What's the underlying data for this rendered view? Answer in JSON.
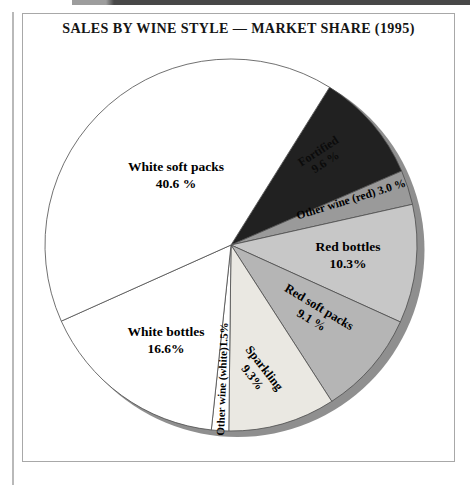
{
  "page": {
    "title": "SALES BY WINE STYLE — MARKET SHARE (1995)"
  },
  "chart_data": {
    "type": "pie",
    "title": "SALES BY WINE STYLE — MARKET SHARE (1995)",
    "year": "1995",
    "direction": "clockwise",
    "start_angle_deg": 32,
    "shadow_color": "#8f8f8f",
    "outline_color": "#4d4d4d",
    "slices": [
      {
        "label": "Fortified",
        "value": 9.6,
        "pct_label": "9.6 %",
        "color": "#212121"
      },
      {
        "label": "Other wine (red)",
        "value": 3.0,
        "pct_label": "3.0 %",
        "single_label": "Other wine (red) 3.0 %",
        "color": "#9a9a9a"
      },
      {
        "label": "Red bottles",
        "value": 10.3,
        "pct_label": "10.3%",
        "color": "#c7c7c7"
      },
      {
        "label": "Red soft packs",
        "value": 9.1,
        "pct_label": "9.1 %",
        "color": "#b5b5b5"
      },
      {
        "label": "Sparkling",
        "value": 9.3,
        "pct_label": "9.3%",
        "color": "#eae8e2"
      },
      {
        "label": "Other wine (white)",
        "value": 1.5,
        "pct_label": "1.5%",
        "single_label": "Other wine (white)1.5%",
        "color": "#ffffff"
      },
      {
        "label": "White bottles",
        "value": 16.6,
        "pct_label": "16.6%",
        "color": "#ffffff"
      },
      {
        "label": "White soft packs",
        "value": 40.6,
        "pct_label": "40.6 %",
        "color": "#ffffff"
      }
    ]
  }
}
